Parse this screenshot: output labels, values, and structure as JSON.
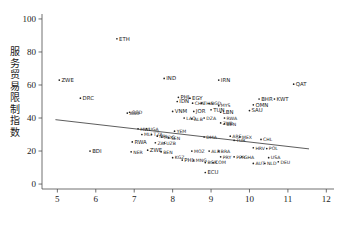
{
  "chart_data": {
    "type": "scatter",
    "title": "",
    "xlabel": "",
    "ylabel": "服务贸易限制指数",
    "xlim": [
      4.6,
      12.2
    ],
    "ylim": [
      -3,
      103
    ],
    "xticks": [
      5,
      6,
      7,
      8,
      9,
      10,
      11,
      12
    ],
    "yticks": [
      0,
      20,
      40,
      60,
      80,
      100
    ],
    "xtick_labels": [
      "5",
      "6",
      "7",
      "8",
      "9",
      "10",
      "11",
      "12"
    ],
    "ytick_labels": [
      "0",
      "20",
      "40",
      "60",
      "80",
      "100"
    ],
    "grid": false,
    "legend": "none",
    "marker_color": "#222222",
    "line_color": "#333333",
    "fit_line": {
      "label": "linear fit",
      "x": [
        4.95,
        11.55
      ],
      "y": [
        39.0,
        21.3
      ]
    },
    "points": [
      {
        "label": "ETH",
        "x": 6.55,
        "y": 88.0
      },
      {
        "label": "ZWE",
        "x": 5.05,
        "y": 63.0
      },
      {
        "label": "DRC",
        "x": 5.6,
        "y": 52.0
      },
      {
        "label": "IND",
        "x": 7.78,
        "y": 64.0
      },
      {
        "label": "IRN",
        "x": 9.2,
        "y": 63.0
      },
      {
        "label": "QAT",
        "x": 11.15,
        "y": 60.5
      },
      {
        "label": "PHL",
        "x": 8.15,
        "y": 52.5
      },
      {
        "label": "EGY",
        "x": 8.45,
        "y": 52.0
      },
      {
        "label": "IDN",
        "x": 8.12,
        "y": 50.0
      },
      {
        "label": "CHN",
        "x": 8.52,
        "y": 49.0
      },
      {
        "label": "THA",
        "x": 8.75,
        "y": 49.0
      },
      {
        "label": "BGD",
        "x": 8.95,
        "y": 48.8
      },
      {
        "label": "MYS",
        "x": 9.2,
        "y": 47.5
      },
      {
        "label": "BHR",
        "x": 10.25,
        "y": 51.5
      },
      {
        "label": "KWT",
        "x": 10.65,
        "y": 51.5
      },
      {
        "label": "OMN",
        "x": 10.1,
        "y": 48.0
      },
      {
        "label": "SAU",
        "x": 10.0,
        "y": 44.5
      },
      {
        "label": "TUN",
        "x": 9.0,
        "y": 45.0
      },
      {
        "label": "LBN",
        "x": 9.25,
        "y": 43.5
      },
      {
        "label": "VNM",
        "x": 8.0,
        "y": 44.0
      },
      {
        "label": "JOR",
        "x": 8.55,
        "y": 44.0
      },
      {
        "label": "GGD",
        "x": 6.88,
        "y": 43.5
      },
      {
        "label": "AGO",
        "x": 6.82,
        "y": 43.0
      },
      {
        "label": "LAO",
        "x": 8.3,
        "y": 40.0
      },
      {
        "label": "ALB",
        "x": 8.5,
        "y": 39.5
      },
      {
        "label": "DZA",
        "x": 8.82,
        "y": 40.0
      },
      {
        "label": "RWA",
        "x": 9.35,
        "y": 40.0
      },
      {
        "label": "ZMB",
        "x": 9.25,
        "y": 37.0
      },
      {
        "label": "BEN",
        "x": 9.35,
        "y": 36.5
      },
      {
        "label": "MWI",
        "x": 7.1,
        "y": 33.5
      },
      {
        "label": "UGA",
        "x": 7.32,
        "y": 33.5
      },
      {
        "label": "YEM",
        "x": 8.05,
        "y": 32.0
      },
      {
        "label": "MLI",
        "x": 7.2,
        "y": 30.0
      },
      {
        "label": "TZA",
        "x": 7.45,
        "y": 30.0
      },
      {
        "label": "NPL",
        "x": 7.6,
        "y": 29.0
      },
      {
        "label": "MDG",
        "x": 7.72,
        "y": 28.5
      },
      {
        "label": "SEN",
        "x": 7.9,
        "y": 28.0
      },
      {
        "label": "RWA",
        "x": 6.95,
        "y": 25.5
      },
      {
        "label": "ZAF",
        "x": 7.55,
        "y": 25.0
      },
      {
        "label": "UZB",
        "x": 7.78,
        "y": 25.0
      },
      {
        "label": "DMA",
        "x": 8.82,
        "y": 28.5
      },
      {
        "label": "ARE",
        "x": 9.5,
        "y": 29.0
      },
      {
        "label": "MEX",
        "x": 9.75,
        "y": 28.5
      },
      {
        "label": "TUR",
        "x": 9.6,
        "y": 26.5
      },
      {
        "label": "CHL",
        "x": 10.3,
        "y": 27.0
      },
      {
        "label": "BDI",
        "x": 5.85,
        "y": 20.0
      },
      {
        "label": "ZWE",
        "x": 7.35,
        "y": 20.5
      },
      {
        "label": "BEN",
        "x": 7.7,
        "y": 19.5
      },
      {
        "label": "NER",
        "x": 6.92,
        "y": 19.5
      },
      {
        "label": "MOZ",
        "x": 8.5,
        "y": 20.0
      },
      {
        "label": "ALB",
        "x": 8.95,
        "y": 20.0
      },
      {
        "label": "BRA",
        "x": 9.2,
        "y": 20.0
      },
      {
        "label": "HRV",
        "x": 10.1,
        "y": 22.0
      },
      {
        "label": "POL",
        "x": 10.45,
        "y": 21.5
      },
      {
        "label": "KGZ",
        "x": 8.0,
        "y": 16.0
      },
      {
        "label": "PHL",
        "x": 8.25,
        "y": 14.5
      },
      {
        "label": "MNG",
        "x": 8.55,
        "y": 14.5
      },
      {
        "label": "BGR",
        "x": 8.85,
        "y": 13.0
      },
      {
        "label": "COM",
        "x": 9.05,
        "y": 13.0
      },
      {
        "label": "PRY",
        "x": 9.25,
        "y": 16.5
      },
      {
        "label": "PER",
        "x": 9.6,
        "y": 16.5
      },
      {
        "label": "GHA",
        "x": 9.8,
        "y": 16.5
      },
      {
        "label": "USA",
        "x": 10.5,
        "y": 16.0
      },
      {
        "label": "AUT",
        "x": 10.1,
        "y": 12.5
      },
      {
        "label": "NLD",
        "x": 10.4,
        "y": 12.5
      },
      {
        "label": "DEU",
        "x": 10.75,
        "y": 13.5
      },
      {
        "label": "ECU",
        "x": 8.85,
        "y": 7.0
      }
    ]
  },
  "axes": {
    "y_axis_title_chars": [
      "服",
      "务",
      "贸",
      "易",
      "限",
      "制",
      "指",
      "数"
    ]
  }
}
